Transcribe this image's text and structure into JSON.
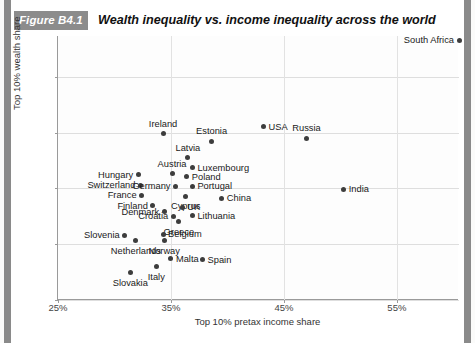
{
  "header": {
    "badge": "Figure B4.1",
    "title": "Wealth inequality vs. income inequality across the world"
  },
  "chart_data": {
    "type": "scatter",
    "title": "Wealth inequality vs. income inequality across the world",
    "xlabel": "Top 10% pretax income share",
    "ylabel": "Top 10% wealth share",
    "xlim": [
      25,
      60.5
    ],
    "ylim": [
      40,
      63.4
    ],
    "xticks": [
      "25%",
      "35%",
      "45%",
      "55%"
    ],
    "xtick_values": [
      25,
      35,
      45,
      55
    ],
    "yticks": [
      "40%",
      "50%",
      "60%",
      "70%",
      "80%"
    ],
    "ytick_values": [
      40,
      50,
      60,
      70,
      80
    ],
    "grid": true,
    "legend": "none",
    "points": [
      {
        "name": "South Africa",
        "x": 60.5,
        "y": 86.5,
        "label_pos": "left"
      },
      {
        "name": "Ireland",
        "x": 34.3,
        "y": 69.8,
        "label_pos": "above"
      },
      {
        "name": "Estonia",
        "x": 38.6,
        "y": 68.4,
        "label_pos": "above"
      },
      {
        "name": "USA",
        "x": 43.2,
        "y": 71.0,
        "label_pos": "right"
      },
      {
        "name": "Russia",
        "x": 47.0,
        "y": 69.0,
        "label_pos": "above"
      },
      {
        "name": "Latvia",
        "x": 36.5,
        "y": 65.5,
        "label_pos": "above"
      },
      {
        "name": "Luxembourg",
        "x": 36.9,
        "y": 63.7,
        "label_pos": "right"
      },
      {
        "name": "Hungary",
        "x": 32.1,
        "y": 62.4,
        "label_pos": "left"
      },
      {
        "name": "Austria",
        "x": 35.1,
        "y": 62.6,
        "label_pos": "above"
      },
      {
        "name": "Poland",
        "x": 36.4,
        "y": 62.1,
        "label_pos": "right"
      },
      {
        "name": "Switzerland",
        "x": 32.3,
        "y": 60.6,
        "label_pos": "left"
      },
      {
        "name": "Germany",
        "x": 35.4,
        "y": 60.4,
        "label_pos": "left"
      },
      {
        "name": "Portugal",
        "x": 36.9,
        "y": 60.4,
        "label_pos": "right"
      },
      {
        "name": "India",
        "x": 50.3,
        "y": 59.8,
        "label_pos": "right"
      },
      {
        "name": "France",
        "x": 32.4,
        "y": 58.8,
        "label_pos": "left"
      },
      {
        "name": "Cyprus",
        "x": 36.3,
        "y": 58.6,
        "label_pos": "below"
      },
      {
        "name": "China",
        "x": 39.5,
        "y": 58.2,
        "label_pos": "right"
      },
      {
        "name": "Finland",
        "x": 33.4,
        "y": 56.9,
        "label_pos": "left"
      },
      {
        "name": "UK",
        "x": 36.0,
        "y": 56.6,
        "label_pos": "right"
      },
      {
        "name": "Denmark",
        "x": 34.4,
        "y": 55.8,
        "label_pos": "left"
      },
      {
        "name": "Croatia",
        "x": 35.2,
        "y": 55.0,
        "label_pos": "left"
      },
      {
        "name": "Lithuania",
        "x": 36.9,
        "y": 55.1,
        "label_pos": "right"
      },
      {
        "name": "Greece",
        "x": 35.7,
        "y": 54.0,
        "label_pos": "below"
      },
      {
        "name": "Slovenia",
        "x": 30.9,
        "y": 51.6,
        "label_pos": "left"
      },
      {
        "name": "Belgium",
        "x": 34.3,
        "y": 51.8,
        "label_pos": "right"
      },
      {
        "name": "Netherlands",
        "x": 31.9,
        "y": 50.6,
        "label_pos": "below"
      },
      {
        "name": "Norway",
        "x": 34.4,
        "y": 50.6,
        "label_pos": "below"
      },
      {
        "name": "Malta",
        "x": 35.0,
        "y": 47.4,
        "label_pos": "right"
      },
      {
        "name": "Spain",
        "x": 37.8,
        "y": 47.2,
        "label_pos": "right"
      },
      {
        "name": "Italy",
        "x": 33.7,
        "y": 46.0,
        "label_pos": "below"
      },
      {
        "name": "Slovakia",
        "x": 31.4,
        "y": 44.9,
        "label_pos": "below"
      }
    ]
  }
}
